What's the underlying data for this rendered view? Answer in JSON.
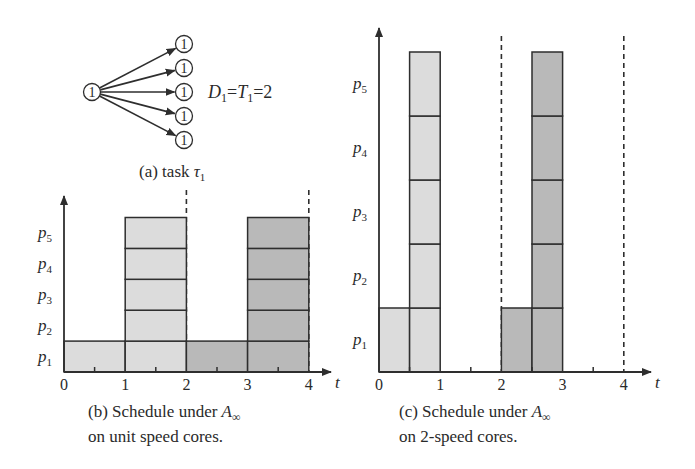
{
  "colors": {
    "light_job": "#dcdcdc",
    "dark_job": "#b9b9b9",
    "stroke": "#2e2e2e"
  },
  "task_graph": {
    "node_label": "1",
    "num_children": 5,
    "equation_D": "D",
    "equation_sub": "1",
    "equation_eq1": "=",
    "equation_T": "T",
    "equation_rest": "=2",
    "caption_prefix": "(a) task ",
    "caption_tau": "τ",
    "caption_sub": "1"
  },
  "chart_b": {
    "processors": [
      "p1",
      "p2",
      "p3",
      "p4",
      "p5"
    ],
    "x_ticks": [
      "0",
      "1",
      "2",
      "3",
      "4"
    ],
    "x_label": "t",
    "caption_line1_prefix": "(b) Schedule under ",
    "caption_A": "A",
    "caption_inf": "∞",
    "caption_line2": "on unit speed cores."
  },
  "chart_c": {
    "processors": [
      "p1",
      "p2",
      "p3",
      "p4",
      "p5"
    ],
    "x_ticks": [
      "0",
      "1",
      "2",
      "3",
      "4"
    ],
    "x_label": "t",
    "caption_line1_prefix": "(c) Schedule under ",
    "caption_A": "A",
    "caption_inf": "∞",
    "caption_line2": "on 2-speed cores."
  },
  "chart_data": [
    {
      "type": "gantt",
      "title": "(b) Schedule under A∞ on unit speed cores.",
      "xlabel": "t",
      "xlim": [
        0,
        4
      ],
      "ylabels": [
        "p1",
        "p2",
        "p3",
        "p4",
        "p5"
      ],
      "deadlines": [
        2,
        4
      ],
      "blocks": [
        {
          "proc": "p1",
          "start": 0,
          "end": 1,
          "job": 1
        },
        {
          "proc": "p1",
          "start": 1,
          "end": 2,
          "job": 1
        },
        {
          "proc": "p2",
          "start": 1,
          "end": 2,
          "job": 1
        },
        {
          "proc": "p3",
          "start": 1,
          "end": 2,
          "job": 1
        },
        {
          "proc": "p4",
          "start": 1,
          "end": 2,
          "job": 1
        },
        {
          "proc": "p5",
          "start": 1,
          "end": 2,
          "job": 1
        },
        {
          "proc": "p1",
          "start": 2,
          "end": 3,
          "job": 2
        },
        {
          "proc": "p1",
          "start": 3,
          "end": 4,
          "job": 2
        },
        {
          "proc": "p2",
          "start": 3,
          "end": 4,
          "job": 2
        },
        {
          "proc": "p3",
          "start": 3,
          "end": 4,
          "job": 2
        },
        {
          "proc": "p4",
          "start": 3,
          "end": 4,
          "job": 2
        },
        {
          "proc": "p5",
          "start": 3,
          "end": 4,
          "job": 2
        }
      ]
    },
    {
      "type": "gantt",
      "title": "(c) Schedule under A∞ on 2-speed cores.",
      "xlabel": "t",
      "xlim": [
        0,
        4
      ],
      "ylabels": [
        "p1",
        "p2",
        "p3",
        "p4",
        "p5"
      ],
      "deadlines": [
        2,
        4
      ],
      "blocks": [
        {
          "proc": "p1",
          "start": 0,
          "end": 0.5,
          "job": 1
        },
        {
          "proc": "p1",
          "start": 0.5,
          "end": 1,
          "job": 1
        },
        {
          "proc": "p2",
          "start": 0.5,
          "end": 1,
          "job": 1
        },
        {
          "proc": "p3",
          "start": 0.5,
          "end": 1,
          "job": 1
        },
        {
          "proc": "p4",
          "start": 0.5,
          "end": 1,
          "job": 1
        },
        {
          "proc": "p5",
          "start": 0.5,
          "end": 1,
          "job": 1
        },
        {
          "proc": "p1",
          "start": 2,
          "end": 2.5,
          "job": 2
        },
        {
          "proc": "p1",
          "start": 2.5,
          "end": 3,
          "job": 2
        },
        {
          "proc": "p2",
          "start": 2.5,
          "end": 3,
          "job": 2
        },
        {
          "proc": "p3",
          "start": 2.5,
          "end": 3,
          "job": 2
        },
        {
          "proc": "p4",
          "start": 2.5,
          "end": 3,
          "job": 2
        },
        {
          "proc": "p5",
          "start": 2.5,
          "end": 3,
          "job": 2
        }
      ]
    }
  ]
}
